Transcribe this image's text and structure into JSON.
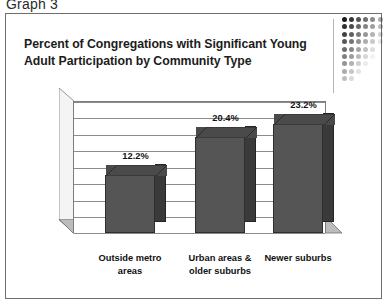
{
  "caption": "Graph 3",
  "title": {
    "line1": "Percent of Congregations with Significant Young",
    "line2": "Adult Participation by Community Type"
  },
  "decoration": {
    "name": "fading-dot-grid",
    "columns": 6,
    "rows": 9,
    "color": "#1a1a1a"
  },
  "chart_data": {
    "type": "bar",
    "title": "Percent of Congregations with Significant Young Adult Participation by Community Type",
    "categories": [
      "Outside metro areas",
      "Urban areas & older suburbs",
      "Newer suburbs"
    ],
    "category_lines": [
      [
        "Outside metro",
        "areas"
      ],
      [
        "Urban areas &",
        "older suburbs"
      ],
      [
        "Newer suburbs"
      ]
    ],
    "values": [
      12.2,
      20.4,
      23.2
    ],
    "data_labels": [
      "12.2%",
      "20.4%",
      "23.2%"
    ],
    "xlabel": "",
    "ylabel": "",
    "ylim": [
      0,
      28
    ],
    "gridlines": 8,
    "grid": true,
    "legend": false,
    "style": "3d-column",
    "bar_color": "#555555",
    "bar_top_color": "#4a4a4a",
    "bar_side_color": "#3a3a3a",
    "floor_color": "#b9b9b9",
    "wall_color": "#f2f2f2"
  }
}
